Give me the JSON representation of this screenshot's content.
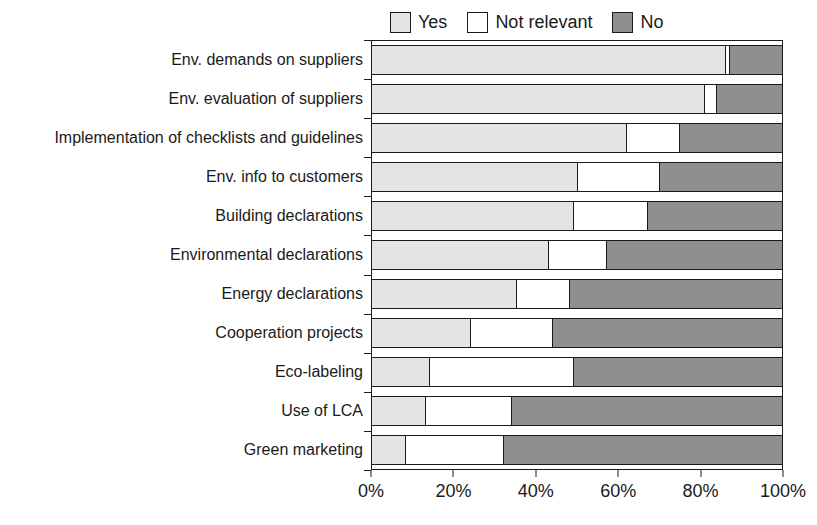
{
  "colors": {
    "background": "#ffffff",
    "border": "#1a1a1a",
    "text": "#1a1a1a",
    "yes": "#e4e4e4",
    "not_relevant": "#ffffff",
    "no": "#8f8f8f"
  },
  "chart_data": {
    "type": "bar",
    "orientation": "horizontal",
    "stacked": true,
    "title": "",
    "xlabel": "",
    "ylabel": "",
    "xlim": [
      0,
      100
    ],
    "grid": false,
    "legend_position": "top",
    "x_ticks": [
      "0%",
      "20%",
      "40%",
      "60%",
      "80%",
      "100%"
    ],
    "categories": [
      "Env. demands on suppliers",
      "Env. evaluation of suppliers",
      "Implementation of checklists and guidelines",
      "Env. info to customers",
      "Building declarations",
      "Environmental declarations",
      "Energy declarations",
      "Cooperation projects",
      "Eco-labeling",
      "Use of LCA",
      "Green marketing"
    ],
    "series": [
      {
        "name": "Yes",
        "color": "#e4e4e4",
        "values": [
          86,
          81,
          62,
          50,
          49,
          43,
          35,
          24,
          14,
          13,
          8
        ]
      },
      {
        "name": "Not relevant",
        "color": "#ffffff",
        "values": [
          1,
          3,
          13,
          20,
          18,
          14,
          13,
          20,
          35,
          21,
          24
        ]
      },
      {
        "name": "No",
        "color": "#8f8f8f",
        "values": [
          13,
          16,
          25,
          30,
          33,
          43,
          52,
          56,
          51,
          66,
          68
        ]
      }
    ]
  }
}
